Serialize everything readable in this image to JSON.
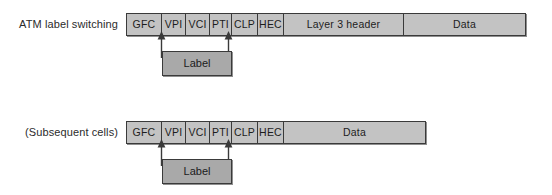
{
  "diagram": {
    "title_top": "ATM label switching",
    "title_bottom": "(Subsequent cells)",
    "label_box_text": "Label",
    "colors": {
      "cell_fill": "#c3c3c3",
      "label_fill": "#a9a9a9",
      "stroke": "#3a3a3a",
      "text": "#1d1d1d",
      "background": "#ffffff"
    },
    "rows": [
      {
        "row_label": "ATM label switching",
        "cells": [
          {
            "text": "GFC",
            "width": 35
          },
          {
            "text": "VPI",
            "width": 24
          },
          {
            "text": "VCI",
            "width": 24
          },
          {
            "text": "PTI",
            "width": 22
          },
          {
            "text": "CLP",
            "width": 26
          },
          {
            "text": "HEC",
            "width": 26
          },
          {
            "text": "Layer 3 header",
            "width": 120
          },
          {
            "text": "Data",
            "width": 123
          }
        ],
        "label_connector": {
          "text": "Label",
          "from_cell": "VPI",
          "to_cell": "PTI"
        }
      },
      {
        "row_label": "(Subsequent cells)",
        "cells": [
          {
            "text": "GFC",
            "width": 35
          },
          {
            "text": "VPI",
            "width": 24
          },
          {
            "text": "VCI",
            "width": 24
          },
          {
            "text": "PTI",
            "width": 22
          },
          {
            "text": "CLP",
            "width": 26
          },
          {
            "text": "HEC",
            "width": 26
          },
          {
            "text": "Data",
            "width": 143
          }
        ],
        "label_connector": {
          "text": "Label",
          "from_cell": "VPI",
          "to_cell": "PTI"
        }
      }
    ]
  }
}
